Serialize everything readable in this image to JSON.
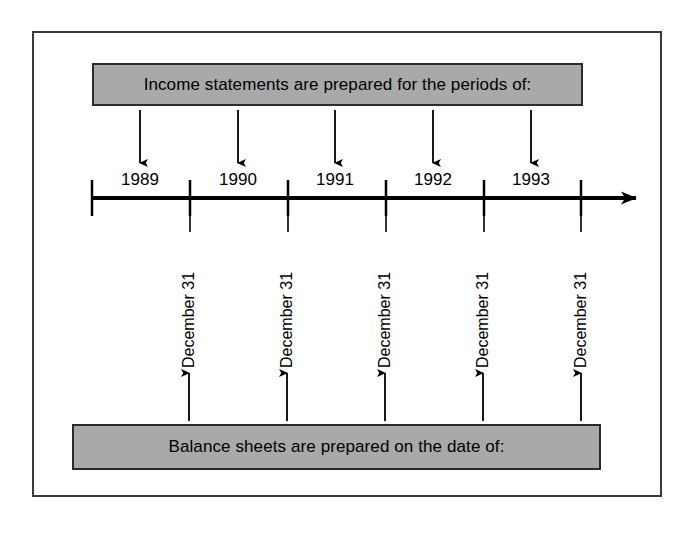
{
  "figure": {
    "colors": {
      "box_fill": "#a9a9a9",
      "box_border": "#2b2b2b",
      "frame_border": "#3a3a3a",
      "line": "#000000",
      "background": "#ffffff"
    }
  },
  "top_caption": {
    "text": "Income statements are prepared for the periods of:"
  },
  "bottom_caption": {
    "text": "Balance sheets are prepared on the date of:"
  },
  "timeline": {
    "axis_label": "time-axis",
    "arrow_direction": "right",
    "years": [
      {
        "label": "1989",
        "x": 140
      },
      {
        "label": "1990",
        "x": 238
      },
      {
        "label": "1991",
        "x": 335
      },
      {
        "label": "1992",
        "x": 433
      },
      {
        "label": "1993",
        "x": 531
      }
    ],
    "tick_x": [
      92,
      190,
      288,
      386,
      484,
      581
    ],
    "axis_y": 198,
    "axis_start_x": 92,
    "axis_end_x": 636
  },
  "down_arrows": {
    "description": "arrows from income statement box to each year period",
    "x": [
      140,
      238,
      335,
      433,
      531
    ],
    "from_y": 110,
    "to_y": 163
  },
  "balance_dates": [
    {
      "label": "December 31",
      "x": 189
    },
    {
      "label": "December 31",
      "x": 287
    },
    {
      "label": "December 31",
      "x": 385
    },
    {
      "label": "December 31",
      "x": 483
    },
    {
      "label": "December 31",
      "x": 581
    }
  ],
  "up_arrows": {
    "description": "arrows from balance sheet box to each December 31 date",
    "x": [
      189,
      287,
      385,
      483,
      581
    ],
    "from_y": 421,
    "to_y": 373
  },
  "stem_lines": {
    "description": "vertical tick stems dropping from timeline ticks to date labels",
    "x": [
      190,
      288,
      386,
      484,
      581
    ],
    "from_y": 198,
    "to_y": 232
  }
}
